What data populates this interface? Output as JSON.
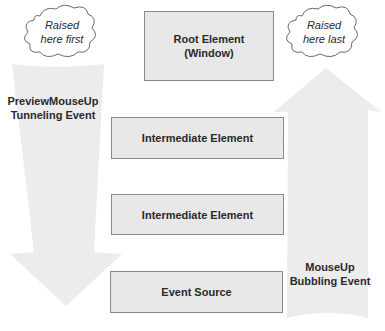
{
  "diagram": {
    "elements": [
      {
        "id": "root",
        "label": "Root Element",
        "sublabel": "(Window)"
      },
      {
        "id": "intermediate1",
        "label": "Intermediate Element"
      },
      {
        "id": "intermediate2",
        "label": "Intermediate Element"
      },
      {
        "id": "source",
        "label": "Event Source"
      }
    ],
    "tunneling": {
      "line1": "PreviewMouseUp",
      "line2": "Tunneling Event",
      "callout_line1": "Raised",
      "callout_line2": "here first",
      "direction": "down"
    },
    "bubbling": {
      "line1": "MouseUp",
      "line2": "Bubbling Event",
      "callout_line1": "Raised",
      "callout_line2": "here last",
      "direction": "up"
    },
    "colors": {
      "arrow_fill": "#ececec",
      "box_fill": "#e8e8e8",
      "box_border": "#8a8a8a",
      "text": "#2a2a2a"
    }
  }
}
